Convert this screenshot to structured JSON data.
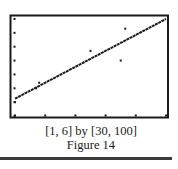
{
  "figure": {
    "window_label": "[1, 6] by [30, 100]",
    "figure_label": "Figure 14"
  },
  "colors": {
    "ink": "#1a1a1a",
    "background": "#ffffff",
    "rule": "#3a3a3a"
  },
  "chart_data": {
    "type": "scatter",
    "title": "",
    "caption": "Figure 14",
    "window": "[1, 6] by [30, 100]",
    "xlabel": "",
    "ylabel": "",
    "xlim": [
      1,
      6
    ],
    "ylim": [
      30,
      100
    ],
    "x_ticks": [
      1,
      2,
      3,
      4,
      5,
      6
    ],
    "y_ticks": [
      30,
      40,
      50,
      60,
      70,
      80,
      90,
      100
    ],
    "grid": false,
    "legend": null,
    "series": [
      {
        "name": "data points",
        "kind": "scatter",
        "points": [
          {
            "x": 1.0,
            "y": 40
          },
          {
            "x": 1.7,
            "y": 50
          },
          {
            "x": 1.8,
            "y": 54
          },
          {
            "x": 3.5,
            "y": 77
          },
          {
            "x": 4.5,
            "y": 70
          },
          {
            "x": 4.65,
            "y": 93
          }
        ]
      },
      {
        "name": "regression line",
        "kind": "line",
        "points": [
          {
            "x": 1,
            "y": 42.5
          },
          {
            "x": 6,
            "y": 100
          }
        ]
      }
    ]
  }
}
